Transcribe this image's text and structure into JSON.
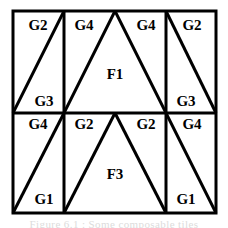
{
  "figure": {
    "type": "geometric-tiling-diagram",
    "colors": {
      "stroke": "#000000",
      "fill": "#ffffff",
      "background": "#ffffff",
      "caption_text": "#dcdcdc"
    },
    "frame": {
      "x": 13,
      "y": 11,
      "width": 203,
      "height": 202,
      "border_width": 3
    },
    "grid": {
      "vertical_dividers_x": [
        64,
        166
      ],
      "horizontal_dividers_y": [
        113
      ],
      "columns": 3,
      "rows": 2
    },
    "cells": [
      {
        "id": "cell-top-left",
        "row": 0,
        "col": 0,
        "diagonal": "bottom-left-to-top-right",
        "labels": [
          {
            "name": "label-g2-top-left",
            "text": "G2",
            "x": 38,
            "y": 27
          },
          {
            "name": "label-g3-top-left",
            "text": "G3",
            "x": 44,
            "y": 103
          }
        ]
      },
      {
        "id": "cell-top-middle",
        "row": 0,
        "col": 1,
        "shape": "triangle-apex-top-center",
        "labels": [
          {
            "name": "label-g4-top-middle-left",
            "text": "G4",
            "x": 84,
            "y": 27
          },
          {
            "name": "label-g4-top-middle-right",
            "text": "G4",
            "x": 146,
            "y": 27
          },
          {
            "name": "label-f1",
            "text": "F1",
            "x": 115,
            "y": 76
          }
        ]
      },
      {
        "id": "cell-top-right",
        "row": 0,
        "col": 2,
        "diagonal": "top-left-to-bottom-right",
        "labels": [
          {
            "name": "label-g2-top-right",
            "text": "G2",
            "x": 192,
            "y": 27
          },
          {
            "name": "label-g3-top-right",
            "text": "G3",
            "x": 186,
            "y": 103
          }
        ]
      },
      {
        "id": "cell-bottom-left",
        "row": 1,
        "col": 0,
        "diagonal": "bottom-left-to-top-right",
        "labels": [
          {
            "name": "label-g4-bottom-left",
            "text": "G4",
            "x": 38,
            "y": 126
          },
          {
            "name": "label-g1-bottom-left",
            "text": "G1",
            "x": 44,
            "y": 201
          }
        ]
      },
      {
        "id": "cell-bottom-middle",
        "row": 1,
        "col": 1,
        "shape": "triangle-apex-top-center",
        "labels": [
          {
            "name": "label-g2-bottom-middle-left",
            "text": "G2",
            "x": 84,
            "y": 126
          },
          {
            "name": "label-g2-bottom-middle-right",
            "text": "G2",
            "x": 146,
            "y": 126
          },
          {
            "name": "label-f3",
            "text": "F3",
            "x": 115,
            "y": 176
          }
        ]
      },
      {
        "id": "cell-bottom-right",
        "row": 1,
        "col": 2,
        "diagonal": "top-left-to-bottom-right",
        "labels": [
          {
            "name": "label-g4-bottom-right",
            "text": "G4",
            "x": 192,
            "y": 126
          },
          {
            "name": "label-g1-bottom-right",
            "text": "G1",
            "x": 186,
            "y": 201
          }
        ]
      }
    ],
    "tile_labels": [
      "G1",
      "G2",
      "G3",
      "G4",
      "F1",
      "F3"
    ],
    "caption_partial": "Figure 6.1 : Some composable tiles"
  }
}
